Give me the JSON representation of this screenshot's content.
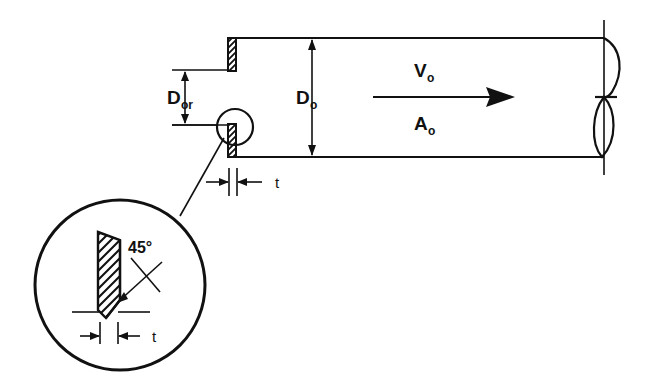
{
  "figure": {
    "background_color": "#ffffff",
    "line_color": "#111111",
    "width": 649,
    "height": 391
  },
  "labels": {
    "orifice_diameter": {
      "base": "D",
      "sub": "or",
      "full": "D_or"
    },
    "pipe_diameter": {
      "base": "D",
      "sub": "o",
      "full": "D_o"
    },
    "velocity": {
      "base": "V",
      "sub": "o",
      "full": "V_o"
    },
    "area": {
      "base": "A",
      "sub": "o",
      "full": "A_o"
    },
    "thickness_main": "t",
    "thickness_detail": "t",
    "bevel_angle": "45°"
  },
  "elements": {
    "pipe": {
      "name": "pipe-wall",
      "top_y": 38,
      "bottom_y": 157,
      "left_x": 228,
      "right_x": 604
    },
    "orifice_plate": {
      "name": "orifice-plate",
      "hatched": true,
      "thickness_label": "t"
    },
    "flow_arrow": {
      "name": "flow-direction-arrow",
      "direction": "right"
    },
    "break_symbol": {
      "name": "pipe-break-symbol",
      "position": "right-end"
    },
    "detail_circle": {
      "name": "detail-view-circle",
      "center_x": 120,
      "center_y": 285,
      "radius": 85
    },
    "callout_circle": {
      "name": "callout-circle",
      "center_x": 235,
      "center_y": 127,
      "radius": 18
    },
    "leader_line": {
      "name": "detail-leader-line"
    }
  }
}
